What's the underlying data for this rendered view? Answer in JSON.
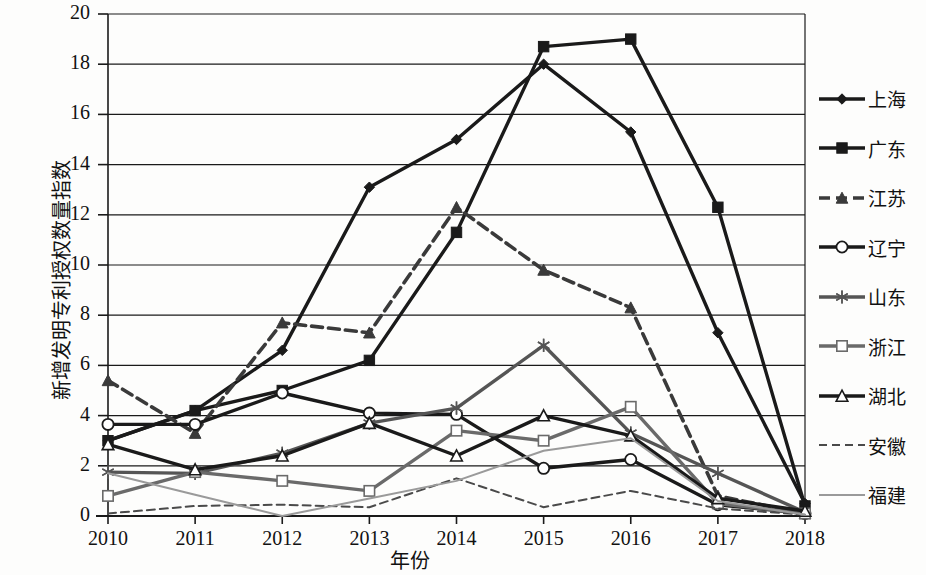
{
  "chart_data": {
    "type": "line",
    "title": "",
    "xlabel": "年份",
    "ylabel": "新增发明专利授权数量指数",
    "categories": [
      "2010",
      "2011",
      "2012",
      "2013",
      "2014",
      "2015",
      "2016",
      "2017",
      "2018"
    ],
    "x": [
      2010,
      2011,
      2012,
      2013,
      2014,
      2015,
      2016,
      2017,
      2018
    ],
    "ylim": [
      0,
      20
    ],
    "yticks": [
      0,
      2,
      4,
      6,
      8,
      10,
      12,
      14,
      16,
      18,
      20
    ],
    "grid": true,
    "legend_position": "right",
    "series": [
      {
        "name": "上海",
        "marker": "diamond",
        "dash": "solid",
        "color": "#1a1a1a",
        "values": [
          3.0,
          4.2,
          6.6,
          13.1,
          15.0,
          18.0,
          15.3,
          7.3,
          0.5
        ]
      },
      {
        "name": "广东",
        "marker": "square",
        "dash": "solid",
        "color": "#1a1a1a",
        "values": [
          3.0,
          4.2,
          5.0,
          6.2,
          11.3,
          18.7,
          19.0,
          12.3,
          0.4
        ]
      },
      {
        "name": "江苏",
        "marker": "triangle-filled",
        "dash": "dashed",
        "color": "#3a3a3a",
        "values": [
          5.4,
          3.3,
          7.7,
          7.3,
          12.3,
          9.8,
          8.3,
          0.8,
          0.1
        ]
      },
      {
        "name": "辽宁",
        "marker": "circle",
        "dash": "solid",
        "color": "#1a1a1a",
        "values": [
          3.65,
          3.65,
          4.9,
          4.1,
          4.05,
          1.9,
          2.25,
          0.45,
          0.1
        ]
      },
      {
        "name": "山东",
        "marker": "asterisk",
        "dash": "solid",
        "color": "#555555",
        "values": [
          1.75,
          1.7,
          2.5,
          3.7,
          4.3,
          6.8,
          3.3,
          1.7,
          0.15
        ]
      },
      {
        "name": "浙江",
        "marker": "square-open",
        "dash": "solid",
        "color": "#6a6a6a",
        "values": [
          0.8,
          1.75,
          1.4,
          1.0,
          3.4,
          3.0,
          4.35,
          0.5,
          0.1
        ]
      },
      {
        "name": "湖北",
        "marker": "triangle-open",
        "dash": "solid",
        "color": "#1a1a1a",
        "values": [
          2.85,
          1.85,
          2.4,
          3.7,
          2.4,
          4.0,
          3.2,
          0.7,
          0.2
        ]
      },
      {
        "name": "安徽",
        "marker": "none",
        "dash": "dashed-thin",
        "color": "#4a4a4a",
        "values": [
          0.1,
          0.4,
          0.45,
          0.35,
          1.5,
          0.35,
          1.0,
          0.3,
          0.05
        ]
      },
      {
        "name": "福建",
        "marker": "none",
        "dash": "solid-thin",
        "color": "#9a9a9a",
        "values": [
          1.7,
          0.85,
          0.0,
          0.7,
          1.4,
          2.6,
          3.1,
          0.6,
          0.05
        ]
      }
    ]
  },
  "legend": {
    "items": [
      {
        "label": "上海"
      },
      {
        "label": "广东"
      },
      {
        "label": "江苏"
      },
      {
        "label": "辽宁"
      },
      {
        "label": "山东"
      },
      {
        "label": "浙江"
      },
      {
        "label": "湖北"
      },
      {
        "label": "安徽"
      },
      {
        "label": "福建"
      }
    ]
  },
  "axes": {
    "y_tick_labels": [
      "20",
      "18",
      "16",
      "14",
      "12",
      "10",
      "8",
      "6",
      "4",
      "2",
      "0"
    ],
    "x_tick_labels": [
      "2010",
      "2011",
      "2012",
      "2013",
      "2014",
      "2015",
      "2016",
      "2017",
      "2018"
    ],
    "y_title": "新增发明专利授权数量指数",
    "x_title": "年份"
  }
}
